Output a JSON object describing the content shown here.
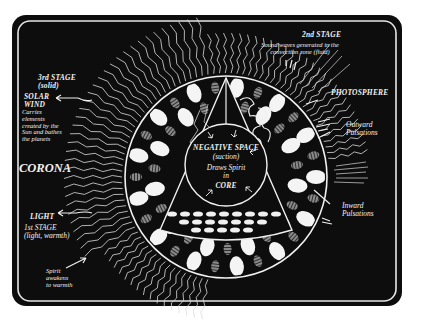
{
  "diagram": {
    "colors": {
      "background": "#0d0d0d",
      "ink": "#f2f2f2",
      "page": "#ffffff",
      "hatched_cell": "#9a9a9a"
    },
    "labels": {
      "third_stage": "3rd STAGE\n(solid)",
      "solar_wind": "SOLAR\nWIND",
      "solar_wind_desc": "Carries\nelements\ncreated by the\nSun and bathes\nthe planets",
      "corona": "CORONA",
      "light": "LIGHT",
      "first_stage": "1st STAGE\n(light, warmth)",
      "spirit_awakens": "Spirit\nawakens\nto warmth",
      "second_stage": "2nd STAGE",
      "sound_waves": "Sound waves generated in the\nconvection zone (fluid)",
      "photosphere": "PHOTOSPHERE",
      "outward_pulsations": "Outward\nPulsations",
      "inward_pulsations": "Inward\nPulsations",
      "negative_space": "NEGATIVE SPACE",
      "suction": "(suction)",
      "draws_spirit": "Draws Spirit\nin",
      "core": "CORE"
    }
  }
}
